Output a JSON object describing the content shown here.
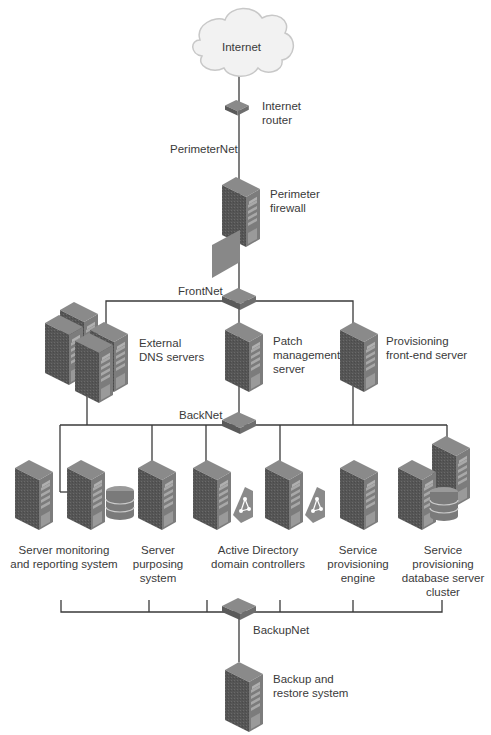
{
  "diagram": {
    "colors": {
      "line": "#3a3a3a",
      "server_front": "#5e5e5e",
      "server_side": "#7a7a7a",
      "server_top": "#8c8c8c",
      "cloud": "#f2f2f2",
      "text": "#3a3a3a"
    },
    "nodes": {
      "internet": {
        "label": "Internet"
      },
      "internet_router": {
        "lines": [
          "Internet",
          "router"
        ]
      },
      "perimeter_firewall": {
        "lines": [
          "Perimeter",
          "firewall"
        ]
      },
      "external_dns": {
        "lines": [
          "External",
          "DNS servers"
        ]
      },
      "patch_mgmt": {
        "lines": [
          "Patch",
          "management",
          "server"
        ]
      },
      "prov_frontend": {
        "lines": [
          "Provisioning",
          "front-end server"
        ]
      },
      "server_monitoring": {
        "lines": [
          "Server monitoring",
          "and reporting system"
        ]
      },
      "server_purposing": {
        "lines": [
          "Server",
          "purposing",
          "system"
        ]
      },
      "ad_dc": {
        "lines": [
          "Active Directory",
          "domain controllers"
        ]
      },
      "svc_prov_engine": {
        "lines": [
          "Service",
          "provisioning",
          "engine"
        ]
      },
      "svc_prov_db": {
        "lines": [
          "Service",
          "provisioning",
          "database server",
          "cluster"
        ]
      },
      "backup": {
        "lines": [
          "Backup and",
          "restore system"
        ]
      }
    },
    "networks": {
      "perimeter": "PerimeterNet",
      "front": "FrontNet",
      "back": "BackNet",
      "backup": "BackupNet"
    }
  }
}
